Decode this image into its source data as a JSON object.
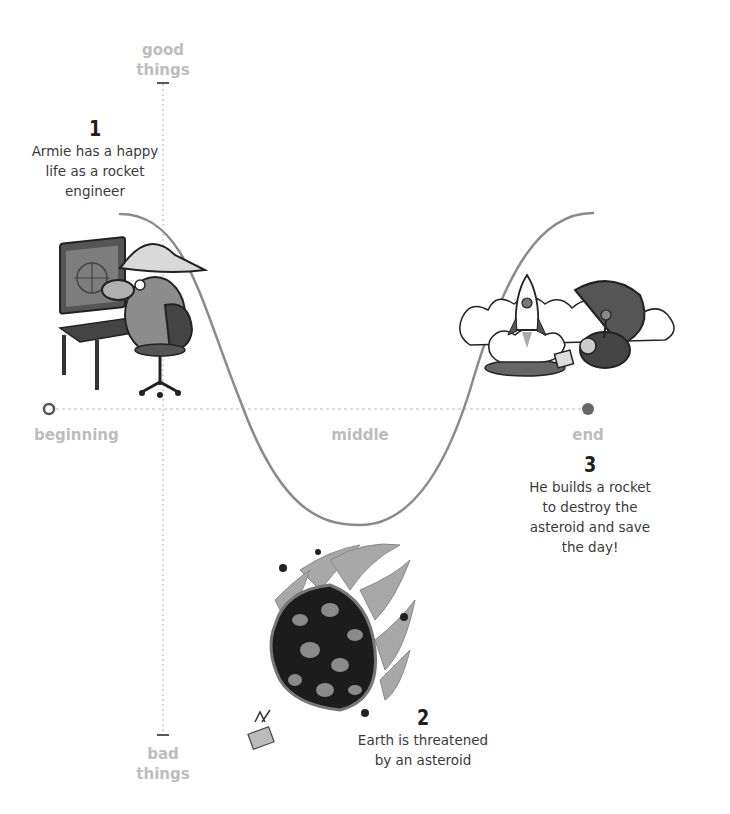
{
  "axes": {
    "y_top_label": [
      "good",
      "things"
    ],
    "y_bottom_label": [
      "bad",
      "things"
    ],
    "x_labels": {
      "start": "beginning",
      "middle": "middle",
      "end": "end"
    }
  },
  "steps": [
    {
      "number": "1",
      "lines": [
        "Armie has a happy",
        "life as a rocket",
        "engineer"
      ]
    },
    {
      "number": "2",
      "lines": [
        "Earth is threatened",
        "by an asteroid"
      ]
    },
    {
      "number": "3",
      "lines": [
        "He builds a rocket",
        "to destroy the",
        "asteroid and save",
        "the day!"
      ]
    }
  ],
  "illustrations": {
    "step1": "character-at-computer",
    "step2": "flaming-asteroid",
    "step3": "rocket-launch-celebration"
  },
  "colors": {
    "curve": "#8a8a8a",
    "axis_label": "#bdbdbd",
    "dots": "#bbbbbb",
    "text": "#3a3a3a"
  }
}
